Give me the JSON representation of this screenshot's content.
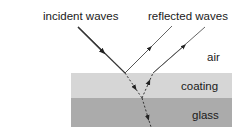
{
  "diagram": {
    "labels": {
      "incident": "incident waves",
      "reflected": "reflected waves",
      "air": "air",
      "coating": "coating",
      "glass": "glass"
    },
    "colors": {
      "coating": "#d6d6d6",
      "glass": "#ababab",
      "ray": "#333333",
      "text": "#1a1a1a"
    }
  }
}
